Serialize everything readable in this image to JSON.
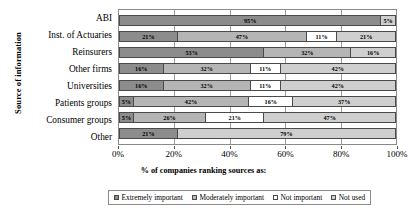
{
  "chart_data": {
    "type": "bar",
    "orientation": "horizontal",
    "stacked": true,
    "normalized_percent": true,
    "title": "",
    "xlabel": "% of companies ranking sources as:",
    "ylabel": "Source of information",
    "xlim": [
      0,
      100
    ],
    "xticks": [
      "0%",
      "20%",
      "40%",
      "60%",
      "80%",
      "100%"
    ],
    "xtick_values": [
      0,
      20,
      40,
      60,
      80,
      100
    ],
    "grid": true,
    "legend_position": "bottom",
    "categories": [
      "ABI",
      "Inst. of Actuaries",
      "Reinsurers",
      "Other firms",
      "Universities",
      "Patients groups",
      "Consumer groups",
      "Other"
    ],
    "series": [
      {
        "name": "Extremely important",
        "color": "#8c8c8c",
        "values": [
          95,
          21,
          53,
          16,
          16,
          5,
          5,
          21
        ]
      },
      {
        "name": "Moderately important",
        "color": "#b5b5b5",
        "values": [
          0,
          47,
          32,
          32,
          32,
          42,
          26,
          0
        ]
      },
      {
        "name": "Not important",
        "color": "#ffffff",
        "values": [
          0,
          11,
          0,
          11,
          11,
          16,
          21,
          0
        ]
      },
      {
        "name": "Not used",
        "color": "#cfcfcf",
        "values": [
          5,
          21,
          16,
          42,
          42,
          37,
          47,
          79
        ]
      }
    ],
    "bars": [
      {
        "category": "ABI",
        "segments": [
          {
            "series": "Extremely important",
            "value": 95,
            "label": "95%",
            "color": "#8c8c8c"
          },
          {
            "series": "Not used",
            "value": 5,
            "label": "5%",
            "color": "#cfcfcf"
          }
        ]
      },
      {
        "category": "Inst. of Actuaries",
        "segments": [
          {
            "series": "Extremely important",
            "value": 21,
            "label": "21%",
            "color": "#8c8c8c"
          },
          {
            "series": "Moderately important",
            "value": 47,
            "label": "47%",
            "color": "#b5b5b5"
          },
          {
            "series": "Not important",
            "value": 11,
            "label": "11%",
            "color": "#ffffff"
          },
          {
            "series": "Not used",
            "value": 21,
            "label": "21%",
            "color": "#cfcfcf"
          }
        ]
      },
      {
        "category": "Reinsurers",
        "segments": [
          {
            "series": "Extremely important",
            "value": 53,
            "label": "53%",
            "color": "#8c8c8c"
          },
          {
            "series": "Moderately important",
            "value": 32,
            "label": "32%",
            "color": "#b5b5b5"
          },
          {
            "series": "Not used",
            "value": 16,
            "label": "16%",
            "color": "#cfcfcf"
          }
        ]
      },
      {
        "category": "Other firms",
        "segments": [
          {
            "series": "Extremely important",
            "value": 16,
            "label": "16%",
            "color": "#8c8c8c"
          },
          {
            "series": "Moderately important",
            "value": 32,
            "label": "32%",
            "color": "#b5b5b5"
          },
          {
            "series": "Not important",
            "value": 11,
            "label": "11%",
            "color": "#ffffff"
          },
          {
            "series": "Not used",
            "value": 42,
            "label": "42%",
            "color": "#cfcfcf"
          }
        ]
      },
      {
        "category": "Universities",
        "segments": [
          {
            "series": "Extremely important",
            "value": 16,
            "label": "16%",
            "color": "#8c8c8c"
          },
          {
            "series": "Moderately important",
            "value": 32,
            "label": "32%",
            "color": "#b5b5b5"
          },
          {
            "series": "Not important",
            "value": 11,
            "label": "11%",
            "color": "#ffffff"
          },
          {
            "series": "Not used",
            "value": 42,
            "label": "42%",
            "color": "#cfcfcf"
          }
        ]
      },
      {
        "category": "Patients groups",
        "segments": [
          {
            "series": "Extremely important",
            "value": 5,
            "label": "5%",
            "color": "#8c8c8c"
          },
          {
            "series": "Moderately important",
            "value": 42,
            "label": "42%",
            "color": "#b5b5b5"
          },
          {
            "series": "Not important",
            "value": 16,
            "label": "16%",
            "color": "#ffffff"
          },
          {
            "series": "Not used",
            "value": 37,
            "label": "37%",
            "color": "#cfcfcf"
          }
        ]
      },
      {
        "category": "Consumer groups",
        "segments": [
          {
            "series": "Extremely important",
            "value": 5,
            "label": "5%",
            "color": "#8c8c8c"
          },
          {
            "series": "Moderately important",
            "value": 26,
            "label": "26%",
            "color": "#b5b5b5"
          },
          {
            "series": "Not important",
            "value": 21,
            "label": "21%",
            "color": "#ffffff"
          },
          {
            "series": "Not used",
            "value": 47,
            "label": "47%",
            "color": "#cfcfcf"
          }
        ]
      },
      {
        "category": "Other",
        "segments": [
          {
            "series": "Extremely important",
            "value": 21,
            "label": "21%",
            "color": "#8c8c8c"
          },
          {
            "series": "Not used",
            "value": 79,
            "label": "79%",
            "color": "#cfcfcf"
          }
        ]
      }
    ],
    "legend": [
      {
        "label": "Extremely important",
        "color": "#8c8c8c"
      },
      {
        "label": "Moderately important",
        "color": "#b5b5b5"
      },
      {
        "label": "Not important",
        "color": "#ffffff"
      },
      {
        "label": "Not used",
        "color": "#cfcfcf"
      }
    ]
  }
}
